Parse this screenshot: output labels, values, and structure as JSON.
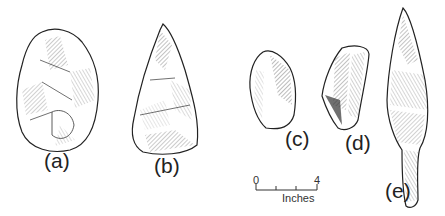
{
  "figure": {
    "artifacts": [
      {
        "id": "a",
        "label": "(a)",
        "description": "ovate hand axe"
      },
      {
        "id": "b",
        "label": "(b)",
        "description": "triangular hand axe"
      },
      {
        "id": "c",
        "label": "(c)",
        "description": "flake tool"
      },
      {
        "id": "d",
        "label": "(d)",
        "description": "blade core"
      },
      {
        "id": "e",
        "label": "(e)",
        "description": "tanged point"
      }
    ],
    "scale": {
      "start": "0",
      "end": "4",
      "unit": "Inches"
    },
    "colors": {
      "ink": "#222222",
      "background": "#ffffff"
    }
  }
}
